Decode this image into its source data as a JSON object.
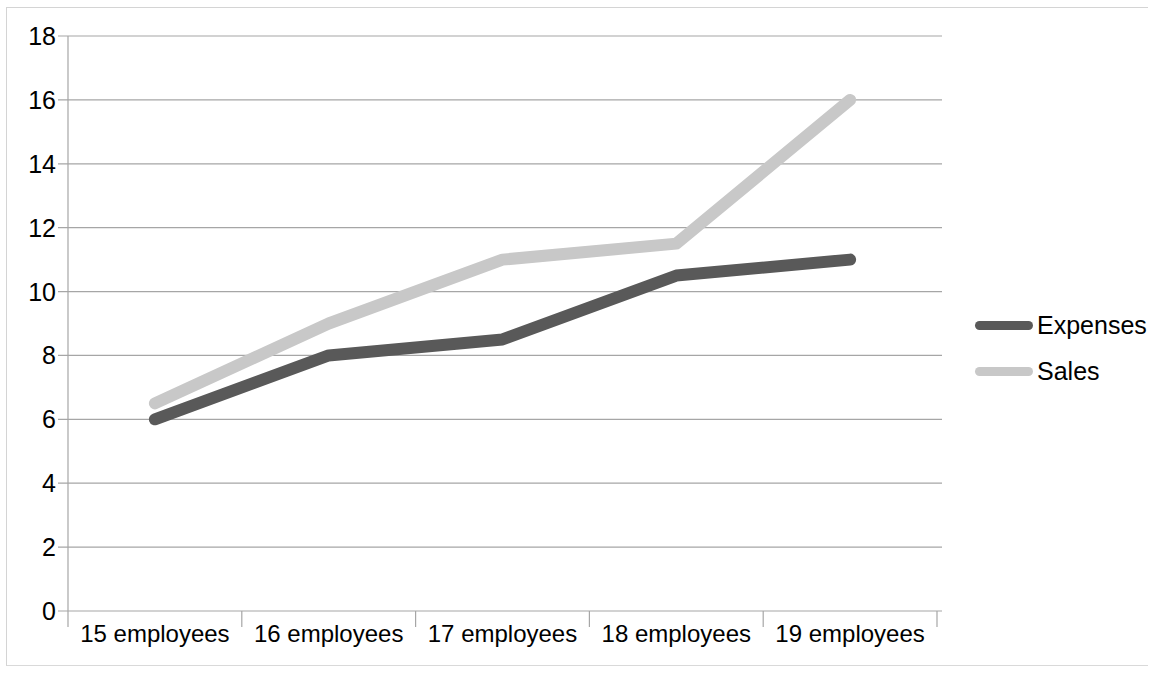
{
  "chart_data": {
    "type": "line",
    "title": "",
    "xlabel": "",
    "ylabel": "",
    "categories": [
      "15 employees",
      "16 employees",
      "17 employees",
      "18 employees",
      "19 employees"
    ],
    "series": [
      {
        "name": "Expenses",
        "values": [
          6,
          8,
          8.5,
          10.5,
          11
        ],
        "color": "#595959"
      },
      {
        "name": "Sales",
        "values": [
          6.5,
          9,
          11,
          11.5,
          16
        ],
        "color": "#c8c8c8"
      }
    ],
    "ylim": [
      0,
      18
    ],
    "ystep": 2,
    "y_ticks": [
      "0",
      "2",
      "4",
      "6",
      "8",
      "10",
      "12",
      "14",
      "16",
      "18"
    ],
    "grid": true,
    "legend_position": "right"
  },
  "legend": {
    "entries": [
      {
        "label": "Expenses"
      },
      {
        "label": "Sales"
      }
    ]
  },
  "colors": {
    "expenses": "#595959",
    "sales": "#c8c8c8",
    "gridline": "#a6a6a6",
    "axis": "#a6a6a6",
    "frame": "#d4d4d4",
    "background": "#ffffff",
    "text": "#000000"
  }
}
